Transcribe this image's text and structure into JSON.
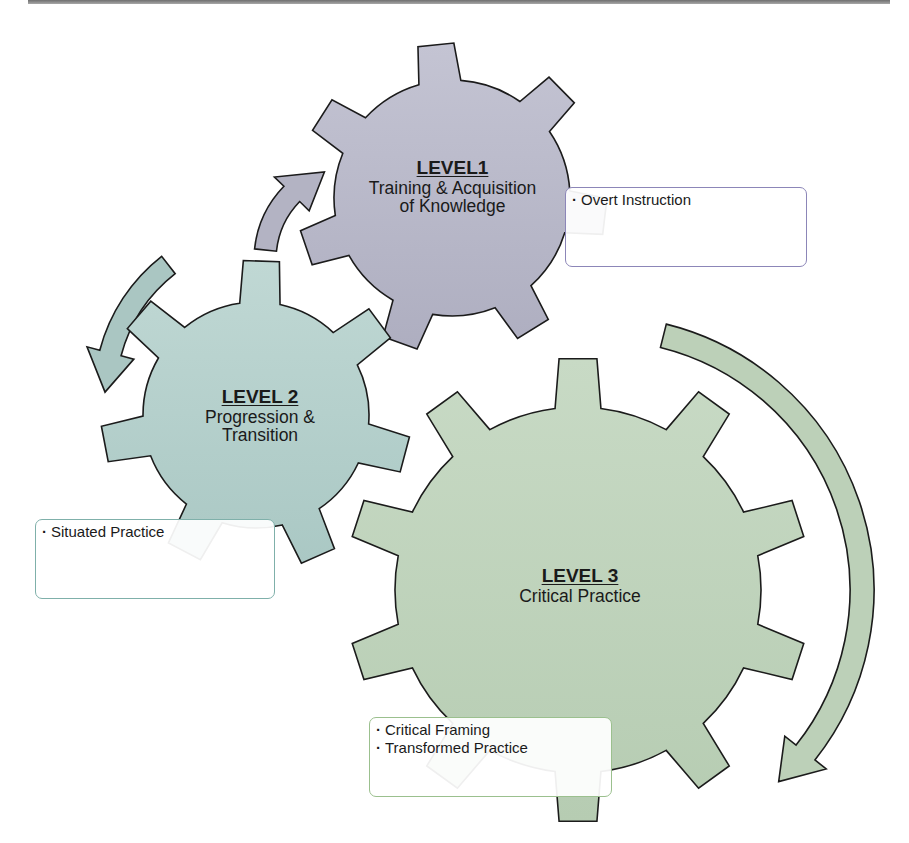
{
  "diagram": {
    "gears": [
      {
        "id": "level1",
        "level_label": "LEVEL1",
        "description_lines": [
          "Training & Acquisition",
          "of Knowledge"
        ],
        "fill": "#aeaec0",
        "fill_light": "#c4c4d3",
        "center": [
          452,
          198
        ],
        "outer_radius": 155,
        "inner_radius": 118,
        "teeth": 7,
        "rotation_deg": -6,
        "label_box": {
          "left": 330,
          "top": 158,
          "width": 245
        },
        "callout": {
          "items": [
            "Overt Instruction"
          ],
          "border": "#8c86b8",
          "box": {
            "left": 565,
            "top": 187,
            "width": 242,
            "height": 80
          }
        }
      },
      {
        "id": "level2",
        "level_label": "LEVEL 2",
        "description_lines": [
          "Progression &",
          "Transition"
        ],
        "fill": "#aac8c4",
        "fill_light": "#c0d8d4",
        "center": [
          256,
          415
        ],
        "outer_radius": 155,
        "inner_radius": 113,
        "teeth": 7,
        "rotation_deg": 2,
        "label_box": {
          "left": 175,
          "top": 387,
          "width": 170
        },
        "callout": {
          "items": [
            "Situated Practice"
          ],
          "border": "#7fb0aa",
          "box": {
            "left": 35,
            "top": 519,
            "width": 240,
            "height": 80
          }
        }
      },
      {
        "id": "level3",
        "level_label": "LEVEL 3",
        "description_lines": [
          "Critical Practice"
        ],
        "fill": "#b6ccb2",
        "fill_light": "#c8dac5",
        "center": [
          578,
          590
        ],
        "outer_radius": 232,
        "inner_radius": 183,
        "teeth": 10,
        "rotation_deg": 0,
        "label_box": {
          "left": 490,
          "top": 566,
          "width": 180
        },
        "callout": {
          "items": [
            "Critical Framing",
            "Transformed Practice"
          ],
          "border": "#9bc08e",
          "box": {
            "left": 369,
            "top": 717,
            "width": 243,
            "height": 80
          }
        }
      }
    ],
    "arrows": [
      {
        "id": "arrow-up-to-level1",
        "direction": "up",
        "fill": "#b3b3c3",
        "center": [
          360,
          260
        ],
        "radius": 95,
        "width": 22,
        "start_deg": 186,
        "end_deg": 248
      },
      {
        "id": "arrow-down-to-level2",
        "direction": "down",
        "fill": "#aac6c2",
        "center": [
          270,
          395
        ],
        "radius": 165,
        "width": 22,
        "start_deg": 232,
        "end_deg": 181
      },
      {
        "id": "arrow-clockwise-around-level3",
        "direction": "clockwise",
        "fill": "#bcd0b8",
        "center": [
          600,
          590
        ],
        "radius": 262,
        "width": 24,
        "start_deg": 284,
        "end_deg": 407
      }
    ],
    "stroke_color": "#1b1b1b"
  }
}
